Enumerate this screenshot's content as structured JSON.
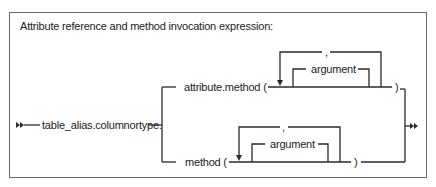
{
  "diagram": {
    "type": "syntax-railroad",
    "title": "Attribute reference and method invocation expression:",
    "start_marker": "double-arrow-start",
    "end_marker": "double-arrow-end",
    "prefix": "table_alias.columnortype.",
    "branches": [
      {
        "name": "attribute-method",
        "label": "attribute.method (",
        "loop": {
          "separator": ",",
          "item": "argument"
        },
        "close": ")"
      },
      {
        "name": "method",
        "label": "method (",
        "loop": {
          "separator": ",",
          "item": "argument"
        },
        "close": ")"
      }
    ],
    "colors": {
      "line": "#2a2a2a",
      "frame": "#6b6b6b",
      "text": "#222222",
      "background": "#ffffff"
    }
  }
}
